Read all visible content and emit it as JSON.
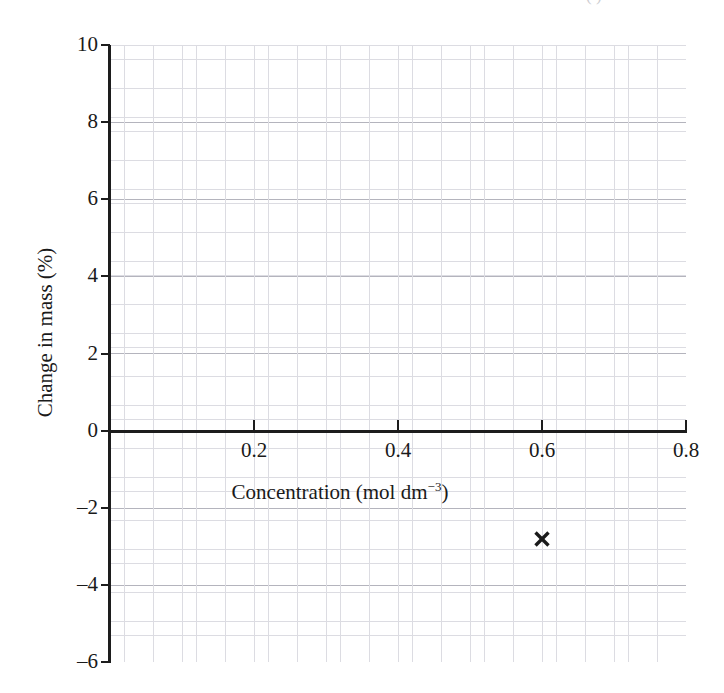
{
  "crop_artifact": {
    "text": "(                      )"
  },
  "chart_data": {
    "type": "scatter",
    "title": "",
    "subtitle": "",
    "xlabel_text": "Concentration (mol dm",
    "xlabel_sup": "−3",
    "xlabel_close": ")",
    "xlabel": "Concentration (mol dm−3)",
    "ylabel": "Change in mass (%)",
    "xlim": [
      0,
      0.8
    ],
    "ylim": [
      -6,
      10
    ],
    "x_ticks": [
      0.2,
      0.4,
      0.6,
      0.8
    ],
    "x_tick_labels": [
      "0.2",
      "0.4",
      "0.6",
      "0.8"
    ],
    "y_ticks": [
      10,
      8,
      6,
      4,
      2,
      0,
      -2,
      -4,
      -6
    ],
    "y_tick_labels": [
      "10",
      "8",
      "6",
      "4",
      "2",
      "0",
      "–2",
      "–4",
      "–6"
    ],
    "grid": true,
    "grid_style": "graph-paper",
    "grid_minor_divisions": 5,
    "legend": null,
    "x_axis_position_y": 0,
    "marker": "x-cross",
    "marker_color": "#1a1a1a",
    "points": [
      {
        "x": 0.6,
        "y": -2.8,
        "label": "✕"
      }
    ],
    "series": [
      {
        "name": "measurement",
        "marker": "x-cross",
        "color": "#1a1a1a",
        "x": [
          0.6
        ],
        "values": [
          -2.8
        ]
      }
    ],
    "colors": {
      "axis": "#1d1d1d",
      "text": "#1a1a1a",
      "grid_minor": "#dcdce2",
      "grid_major": "#b4b4bd",
      "background": "#ffffff",
      "marker": "#1a1a1a"
    }
  }
}
